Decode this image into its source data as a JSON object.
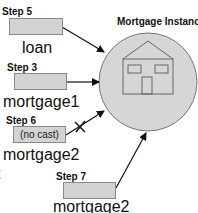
{
  "diagram": {
    "title": "Mortgage Instance",
    "references": [
      {
        "step": "Step 5",
        "name": "loan",
        "box_text": "",
        "blocked": false
      },
      {
        "step": "Step 3",
        "name": "mortgage1",
        "box_text": "",
        "blocked": false
      },
      {
        "step": "Step 6",
        "name": "mortgage2",
        "box_text": "(no cast)",
        "blocked": true
      },
      {
        "step": "Step 7",
        "name": "mortgage2",
        "box_text": "",
        "blocked": false
      }
    ],
    "clipped_text": "t",
    "colors": {
      "box_fill": "#d3d3d3",
      "circle_fill": "#d6d6d6",
      "stroke": "#555555",
      "arrow": "#111111"
    }
  }
}
